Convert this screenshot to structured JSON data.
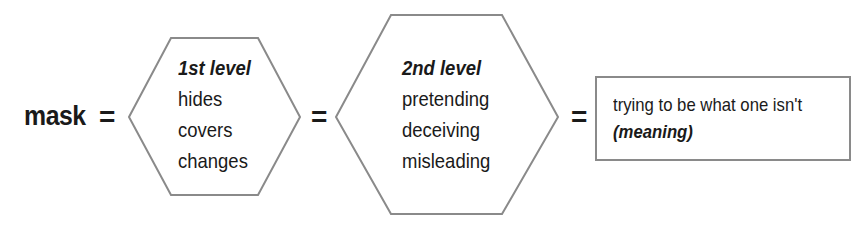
{
  "diagram": {
    "term": "mask",
    "equals_symbol": "=",
    "level_1": {
      "heading": "1st level",
      "items": [
        "hides",
        "covers",
        "changes"
      ]
    },
    "level_2": {
      "heading": "2nd level",
      "items": [
        "pretending",
        "deceiving",
        "misleading"
      ]
    },
    "meaning_box": {
      "text": "trying to be what one isn't",
      "label": "(meaning)"
    },
    "colors": {
      "text": "#1a1a1a",
      "border": "#8a8a8a",
      "background": "#ffffff"
    }
  }
}
